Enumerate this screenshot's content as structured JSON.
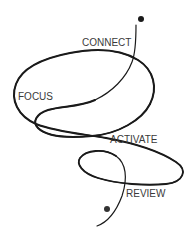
{
  "diagram": {
    "type": "flow-loop",
    "stages": [
      {
        "id": "connect",
        "label": "CONNECT"
      },
      {
        "id": "focus",
        "label": "FOCUS"
      },
      {
        "id": "activate",
        "label": "ACTIVATE"
      },
      {
        "id": "review",
        "label": "REVIEW"
      }
    ],
    "start_marker": "dot",
    "end_marker": "dot",
    "colors": {
      "line": "#1a1a1a",
      "text": "#3a3a3a",
      "background": "#ffffff"
    }
  }
}
